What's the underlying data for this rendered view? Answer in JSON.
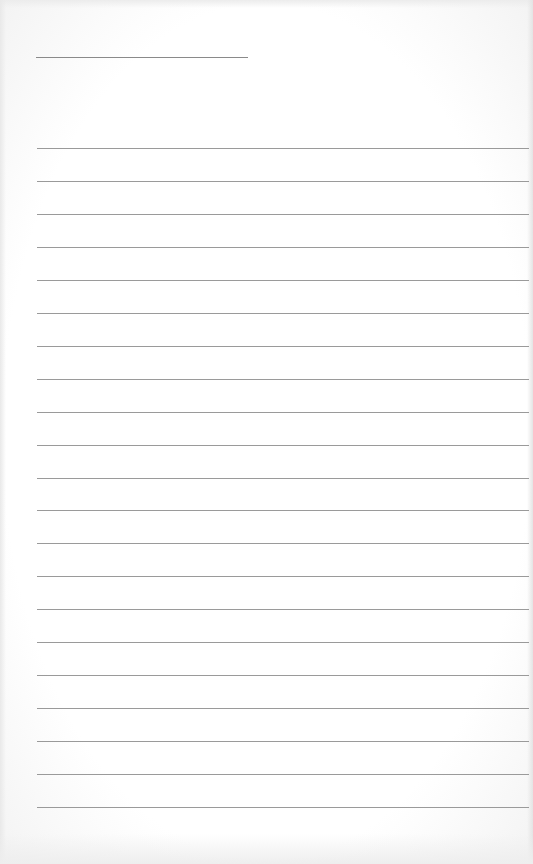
{
  "page": {
    "type": "lined-paper",
    "background_color": "#ffffff",
    "rule_color": "#9a9a9a",
    "title_line": {
      "x": 36,
      "y": 57,
      "width": 212
    },
    "rules": {
      "count": 21,
      "start_y": 148,
      "spacing": 32.95,
      "left_x": 37
    }
  }
}
